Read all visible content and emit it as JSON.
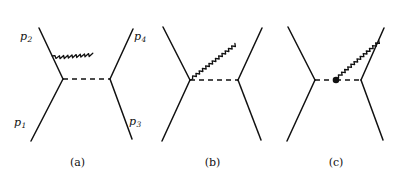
{
  "figure": {
    "type": "feynman-diagram-set",
    "background_color": "#ffffff",
    "line_color": "#111111",
    "panel_count": 3
  },
  "panels": [
    {
      "id": "a",
      "caption": "(a)",
      "description": "t-channel scattering with photon emitted from incoming upper-left fermion leg",
      "momentum_labels": [
        {
          "name": "p1",
          "text": "p",
          "subscript": "1",
          "position": "bottom-left"
        },
        {
          "name": "p2",
          "text": "p",
          "subscript": "2",
          "position": "top-left"
        },
        {
          "name": "p3",
          "text": "p",
          "subscript": "3",
          "position": "bottom-right"
        },
        {
          "name": "p4",
          "text": "p",
          "subscript": "4",
          "position": "top-right"
        }
      ],
      "has_vertex_dot": false,
      "photon_origin": "upper-left-fermion-leg"
    },
    {
      "id": "b",
      "caption": "(b)",
      "description": "t-channel scattering with photon emitted from the left interaction vertex",
      "momentum_labels": [],
      "has_vertex_dot": false,
      "photon_origin": "left-vertex"
    },
    {
      "id": "c",
      "caption": "(c)",
      "description": "t-channel scattering with photon emitted from a point on the dashed propagator, marked by a filled dot",
      "momentum_labels": [],
      "has_vertex_dot": true,
      "photon_origin": "propagator-dot"
    }
  ]
}
